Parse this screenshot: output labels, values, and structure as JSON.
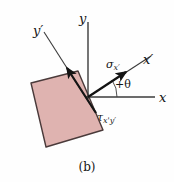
{
  "figure": {
    "caption": "(b)",
    "background_color": "#fefefe",
    "element_color": "#141414",
    "element": {
      "name": "rotated-stress-element",
      "fill_color": "#dfb3b0",
      "stroke_color": "#4a3a3a",
      "rotation_deg": -22,
      "corners": [
        {
          "x": 78,
          "y": 71
        },
        {
          "x": 31,
          "y": 83
        },
        {
          "x": 46,
          "y": 147
        },
        {
          "x": 103,
          "y": 130
        }
      ]
    },
    "axes": [
      {
        "id": "y-axis",
        "label": "y",
        "label_has_prime": false,
        "x1": 88,
        "y1": 97,
        "x2": 88,
        "y2": 20
      },
      {
        "id": "x-axis",
        "label": "x",
        "label_has_prime": false,
        "x1": 88,
        "y1": 97,
        "x2": 156,
        "y2": 97
      },
      {
        "id": "y-prime-axis",
        "label": "y",
        "label_has_prime": true,
        "x1": 95,
        "y1": 112,
        "x2": 44,
        "y2": 32
      },
      {
        "id": "x-prime-axis",
        "label": "x",
        "label_has_prime": true,
        "x1": 88,
        "y1": 97,
        "x2": 152,
        "y2": 56
      }
    ],
    "stress_vectors": [
      {
        "id": "sigma-x-prime",
        "symbol": "σ",
        "subscript": "x",
        "subscript_has_prime": true,
        "description": "normal-stress-arrow",
        "x1": 88,
        "y1": 97,
        "x2": 129,
        "y2": 70
      },
      {
        "id": "tau-x-prime-y-prime",
        "symbol": "τ",
        "subscript": "x'y",
        "subscript_has_prime": true,
        "description": "shear-stress-arrow",
        "x1": 96,
        "y1": 112,
        "x2": 64,
        "y2": 64
      }
    ],
    "angle": {
      "id": "theta-angle",
      "label": "+θ",
      "symbol": "θ",
      "sign": "+",
      "between": [
        "x-axis",
        "x-prime-axis"
      ],
      "arc_radius": 28
    }
  }
}
